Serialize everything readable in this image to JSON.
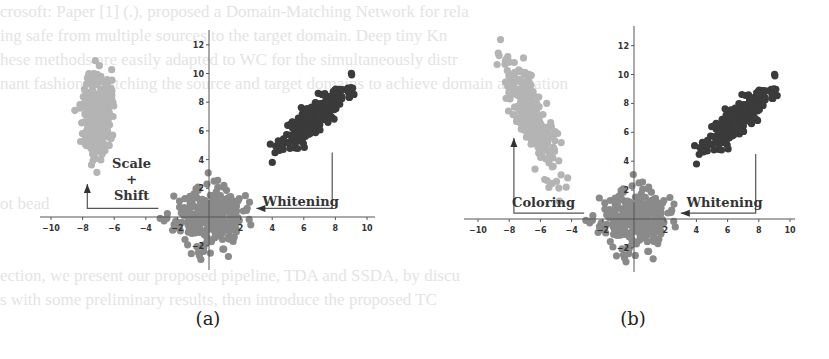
{
  "figure": {
    "background_text_lines": [
      "crosoft: Paper [1] (.), proposed a Domain-Matching Network for rela",
      "ing safe from multiple sources to the target domain. Deep tiny Kn",
      "hese methods are easily adapted to WC for the simultaneously distr",
      "nant fashion. Matching the source and target domains to achieve domain adaptation",
      "",
      "",
      "",
      "",
      "ot bead",
      "",
      "",
      "ection, we present our proposed pipeline, TDA and SSDA, by discu",
      "s with some preliminary results, then introduce the proposed TC"
    ]
  },
  "chart_data": [
    {
      "type": "scatter",
      "panel_label": "(a)",
      "title": "",
      "xlabel": "",
      "ylabel": "",
      "xlim": [
        -10.5,
        10.5
      ],
      "ylim": [
        -3.5,
        13
      ],
      "xticks": [
        -10,
        -8,
        -6,
        -4,
        -2,
        2,
        4,
        6,
        8,
        10
      ],
      "yticks": [
        -2,
        2,
        4,
        6,
        8,
        10,
        12
      ],
      "grid": false,
      "series": [
        {
          "name": "source (correlated)",
          "color": "#3b3b3b",
          "n": 300,
          "mean": [
            6.7,
            7.0
          ],
          "std": [
            1.0,
            1.0
          ],
          "corr": 0.85,
          "seed": 11
        },
        {
          "name": "whitened (centered)",
          "color": "#8a8a8a",
          "n": 300,
          "mean": [
            0.0,
            0.0
          ],
          "std": [
            1.05,
            1.0
          ],
          "corr": 0.0,
          "seed": 23
        },
        {
          "name": "scaled + shifted",
          "color": "#b4b4b4",
          "n": 300,
          "mean": [
            -7.1,
            7.3
          ],
          "std": [
            0.45,
            1.5
          ],
          "corr": 0.1,
          "seed": 37
        }
      ],
      "annotations": [
        {
          "text": "Whitening",
          "x": 5.8,
          "y": 0.8
        },
        {
          "text": "Scale",
          "x": -4.9,
          "y": 3.4
        },
        {
          "text": "+",
          "x": -4.9,
          "y": 2.3
        },
        {
          "text": "Shift",
          "x": -4.9,
          "y": 1.2
        }
      ],
      "arrows": [
        {
          "name": "whitening-arrow",
          "path": [
            [
              7.8,
              4.5
            ],
            [
              7.8,
              0.6
            ],
            [
              3.0,
              0.6
            ]
          ]
        },
        {
          "name": "scale-shift-arrow",
          "path": [
            [
              -3.2,
              0.6
            ],
            [
              -7.7,
              0.6
            ],
            [
              -7.7,
              2.3
            ]
          ]
        }
      ]
    },
    {
      "type": "scatter",
      "panel_label": "(b)",
      "title": "",
      "xlabel": "",
      "ylabel": "",
      "xlim": [
        -10.5,
        10.5
      ],
      "ylim": [
        -3.5,
        13
      ],
      "xticks": [
        -10,
        -8,
        -6,
        -4,
        -2,
        2,
        4,
        6,
        8,
        10
      ],
      "yticks": [
        -2,
        2,
        4,
        6,
        8,
        10,
        12
      ],
      "grid": false,
      "series": [
        {
          "name": "source (correlated)",
          "color": "#3b3b3b",
          "n": 300,
          "mean": [
            6.7,
            7.0
          ],
          "std": [
            1.0,
            1.0
          ],
          "corr": 0.85,
          "seed": 11
        },
        {
          "name": "whitened (centered)",
          "color": "#8a8a8a",
          "n": 300,
          "mean": [
            0.0,
            0.0
          ],
          "std": [
            1.05,
            1.0
          ],
          "corr": 0.0,
          "seed": 23
        },
        {
          "name": "colored",
          "color": "#b4b4b4",
          "n": 300,
          "mean": [
            -6.6,
            7.2
          ],
          "std": [
            0.9,
            2.0
          ],
          "corr": -0.82,
          "seed": 41
        }
      ],
      "annotations": [
        {
          "text": "Whitening",
          "x": 5.8,
          "y": 0.8
        },
        {
          "text": "Coloring",
          "x": -5.8,
          "y": 0.8
        }
      ],
      "arrows": [
        {
          "name": "whitening-arrow",
          "path": [
            [
              7.8,
              4.5
            ],
            [
              7.8,
              0.4
            ],
            [
              3.0,
              0.4
            ]
          ]
        },
        {
          "name": "coloring-arrow",
          "path": [
            [
              -3.2,
              0.4
            ],
            [
              -7.7,
              0.4
            ],
            [
              -7.7,
              5.6
            ]
          ]
        }
      ]
    }
  ],
  "panels": [
    {
      "id": "a",
      "left": 30,
      "width": 370,
      "caption": "(a)",
      "caption_x": 208,
      "origin": [
        209,
        217
      ],
      "sx": 15.8,
      "sy": 14.35,
      "y_top": 30,
      "y_bottom": 270,
      "x_left": 40,
      "x_right": 375
    },
    {
      "id": "b",
      "left": 455,
      "width": 370,
      "caption": "(b)",
      "caption_x": 633,
      "origin": [
        634,
        219
      ],
      "sx": 15.6,
      "sy": 14.45,
      "y_top": 26,
      "y_bottom": 272,
      "x_left": 464,
      "x_right": 795
    }
  ]
}
